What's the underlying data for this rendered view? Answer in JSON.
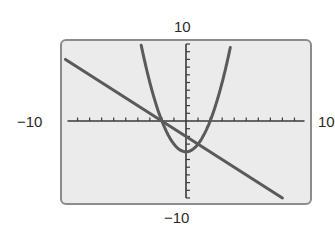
{
  "chart_data": {
    "type": "line",
    "title": "",
    "xlabel": "",
    "ylabel": "",
    "window": {
      "xmin": -10,
      "xmax": 10,
      "xscl": 1,
      "ymin": -10,
      "ymax": 10,
      "yscl": 1
    },
    "tick_labels": {
      "xmin_label": "−10",
      "xmax_label": "10",
      "ymin_label": "−10",
      "ymax_label": "10"
    },
    "grid": false,
    "legend": null,
    "series": [
      {
        "name": "parabola",
        "equation": "y = x^2 - 4",
        "x": [
          -3.7,
          -3,
          -2,
          -1,
          0,
          1,
          2,
          3,
          3.7
        ],
        "y": [
          9.69,
          5,
          0,
          -3,
          -4,
          -3,
          0,
          5,
          9.69
        ]
      },
      {
        "name": "line",
        "equation": "y = -x - 2",
        "x": [
          -10,
          -2,
          0,
          1,
          8
        ],
        "y": [
          8,
          0,
          -2,
          -3,
          -10
        ]
      }
    ],
    "intersections": [
      {
        "x": -2,
        "y": 0
      },
      {
        "x": 1,
        "y": -3
      }
    ]
  },
  "colors": {
    "frame_fill": "#ebebeb",
    "frame_stroke": "#8c8c8c",
    "axis": "#3a3a3a",
    "curve": "#5a5a5a"
  }
}
